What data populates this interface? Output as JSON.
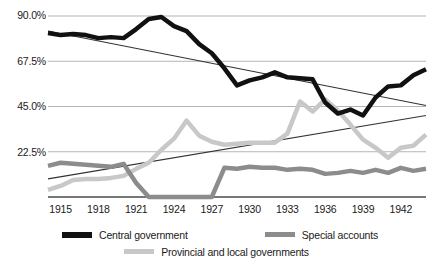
{
  "chart_data": {
    "type": "line",
    "title": "",
    "xlabel": "",
    "ylabel": "",
    "xlim": [
      1914,
      1944
    ],
    "ylim": [
      0,
      90
    ],
    "grid": true,
    "yticks": [
      22.5,
      45.0,
      67.5,
      90.0
    ],
    "ytick_labels": [
      "22.5%",
      "45.0%",
      "67.5%",
      "90.0%"
    ],
    "xticks": [
      1915,
      1918,
      1921,
      1924,
      1927,
      1930,
      1933,
      1936,
      1939,
      1942
    ],
    "xtick_labels": [
      "1915",
      "1918",
      "1921",
      "1924",
      "1927",
      "1930",
      "1933",
      "1936",
      "1939",
      "1942"
    ],
    "x": [
      1914,
      1915,
      1916,
      1917,
      1918,
      1919,
      1920,
      1921,
      1922,
      1923,
      1924,
      1925,
      1926,
      1927,
      1928,
      1929,
      1930,
      1931,
      1932,
      1933,
      1934,
      1935,
      1936,
      1937,
      1938,
      1939,
      1940,
      1941,
      1942,
      1943,
      1944
    ],
    "legend_position": "bottom",
    "series": [
      {
        "name": "Central government",
        "color": "#111111",
        "width": 4.5,
        "values": [
          81.5,
          80.5,
          81.0,
          80.5,
          79.0,
          79.5,
          79.0,
          83.5,
          88.5,
          89.5,
          85.0,
          82.5,
          76.0,
          71.5,
          64.0,
          55.5,
          58.0,
          59.5,
          62.0,
          59.5,
          59.0,
          58.5,
          47.0,
          41.5,
          43.5,
          40.5,
          49.5,
          55.0,
          55.5,
          60.5,
          63.5
        ]
      },
      {
        "name": "Provincial and local governments",
        "color": "#c8c8c8",
        "width": 4.5,
        "values": [
          3.5,
          5.5,
          8.5,
          9.0,
          9.0,
          9.5,
          10.5,
          14.0,
          17.0,
          23.5,
          29.0,
          38.0,
          30.5,
          27.5,
          26.0,
          26.5,
          27.0,
          27.0,
          27.0,
          31.5,
          47.5,
          42.5,
          48.5,
          43.0,
          36.0,
          28.5,
          24.5,
          19.5,
          24.5,
          25.5,
          31.0
        ]
      },
      {
        "name": "Special accounts",
        "color": "#8c8c8c",
        "width": 4.5,
        "values": [
          15.5,
          17.0,
          16.5,
          16.0,
          15.5,
          15.0,
          16.5,
          7.0,
          0.0,
          0.0,
          0.0,
          0.0,
          0.0,
          0.0,
          14.5,
          14.0,
          15.0,
          14.5,
          14.5,
          13.5,
          14.0,
          13.5,
          11.5,
          12.0,
          13.0,
          12.0,
          13.5,
          12.0,
          14.5,
          13.0,
          14.0
        ]
      }
    ],
    "trendlines": [
      {
        "name": "central-government-trend",
        "color": "#333333",
        "from": [
          1914,
          82.5
        ],
        "to": [
          1944,
          45.5
        ],
        "direction": "decreasing"
      },
      {
        "name": "provincial-local-trend",
        "color": "#333333",
        "from": [
          1914,
          9.0
        ],
        "to": [
          1944,
          40.5
        ],
        "direction": "increasing"
      }
    ],
    "legend": [
      {
        "label": "Central government",
        "color": "#111111",
        "key": "central-government"
      },
      {
        "label": "Special accounts",
        "color": "#8c8c8c",
        "key": "special-accounts"
      },
      {
        "label": "Provincial and local governments",
        "color": "#c8c8c8",
        "key": "provincial-and-local-governments"
      }
    ]
  }
}
